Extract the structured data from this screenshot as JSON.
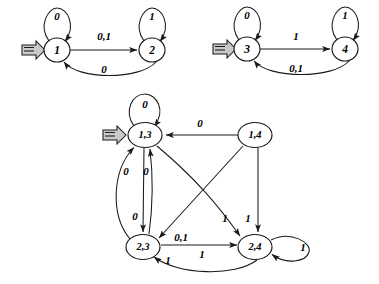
{
  "figure": {
    "background_color": "#ffffff",
    "stroke_color": "#1a1a1a",
    "start_marker_color": "#c9c9c9",
    "alphabet": [
      "0",
      "1"
    ]
  },
  "automata": [
    {
      "id": "automaton-a",
      "name": "automaton-left",
      "states": [
        {
          "id": "s1",
          "label": "1",
          "cx": 57,
          "cy": 50,
          "rx": 13,
          "ry": 12,
          "start": true
        },
        {
          "id": "s2",
          "label": "2",
          "cx": 152,
          "cy": 50,
          "rx": 13,
          "ry": 12,
          "start": false
        }
      ],
      "transitions": [
        {
          "from": "s1",
          "to": "s1",
          "label": "0",
          "kind": "self-loop-top",
          "label_x": 57,
          "label_y": 16
        },
        {
          "from": "s2",
          "to": "s2",
          "label": "1",
          "kind": "self-loop-top",
          "label_x": 152,
          "label_y": 16
        },
        {
          "from": "s1",
          "to": "s2",
          "label": "0,1",
          "kind": "straight",
          "label_x": 104,
          "label_y": 36
        },
        {
          "from": "s2",
          "to": "s1",
          "label": "0",
          "kind": "curve-below",
          "label_x": 104,
          "label_y": 68
        }
      ]
    },
    {
      "id": "automaton-b",
      "name": "automaton-right",
      "states": [
        {
          "id": "s3",
          "label": "3",
          "cx": 247,
          "cy": 49,
          "rx": 13,
          "ry": 12,
          "start": true
        },
        {
          "id": "s4",
          "label": "4",
          "cx": 345,
          "cy": 49,
          "rx": 13,
          "ry": 12,
          "start": false
        }
      ],
      "transitions": [
        {
          "from": "s3",
          "to": "s3",
          "label": "0",
          "kind": "self-loop-top",
          "label_x": 247,
          "label_y": 15
        },
        {
          "from": "s4",
          "to": "s4",
          "label": "1",
          "kind": "self-loop-top",
          "label_x": 345,
          "label_y": 15
        },
        {
          "from": "s3",
          "to": "s4",
          "label": "1",
          "kind": "straight",
          "label_x": 296,
          "label_y": 36
        },
        {
          "from": "s4",
          "to": "s3",
          "label": "0,1",
          "kind": "curve-below",
          "label_x": 296,
          "label_y": 67
        }
      ]
    },
    {
      "id": "automaton-product",
      "name": "product-automaton",
      "states": [
        {
          "id": "p13",
          "label": "1,3",
          "cx": 145,
          "cy": 135,
          "rx": 17,
          "ry": 12.5,
          "start": true
        },
        {
          "id": "p14",
          "label": "1,4",
          "cx": 255,
          "cy": 135,
          "rx": 17,
          "ry": 12.5,
          "start": false
        },
        {
          "id": "p23",
          "label": "2,3",
          "cx": 143,
          "cy": 247,
          "rx": 17,
          "ry": 12.5,
          "start": false
        },
        {
          "id": "p24",
          "label": "2,4",
          "cx": 255,
          "cy": 247,
          "rx": 17,
          "ry": 12.5,
          "start": false
        }
      ],
      "transitions": [
        {
          "from": "p13",
          "to": "p13",
          "label": "0",
          "kind": "self-loop-top",
          "label_x": 145,
          "label_y": 104
        },
        {
          "from": "p14",
          "to": "p13",
          "label": "0",
          "kind": "straight-horizontal",
          "label_x": 200,
          "label_y": 123
        },
        {
          "from": "p13",
          "to": "p23",
          "label": "0",
          "kind": "straight-vertical",
          "label_x": 135,
          "label_y": 216
        },
        {
          "from": "p23",
          "to": "p13",
          "label": "0",
          "kind": "vertical-inner",
          "label_x": 144,
          "label_y": 172
        },
        {
          "from": "p23",
          "to": "p13",
          "label": "0",
          "kind": "curve-left-outer",
          "label_x": 124,
          "label_y": 172
        },
        {
          "from": "p14",
          "to": "p23",
          "label": "0,1",
          "kind": "diagonal",
          "label_x": 180,
          "label_y": 237
        },
        {
          "from": "p13",
          "to": "p24",
          "label": "1",
          "kind": "diagonal-curve",
          "label_x": 226,
          "label_y": 218
        },
        {
          "from": "p14",
          "to": "p24",
          "label": "1",
          "kind": "straight-vertical",
          "label_x": 248,
          "label_y": 218
        },
        {
          "from": "p23",
          "to": "p24",
          "label": "1",
          "kind": "straight-horizontal",
          "label_x": 200,
          "label_y": 253
        },
        {
          "from": "p24",
          "to": "p23",
          "label": "1",
          "kind": "curve-below",
          "label_x": 166,
          "label_y": 262
        },
        {
          "from": "p24",
          "to": "p24",
          "label": "1",
          "kind": "self-loop-right",
          "label_x": 302,
          "label_y": 247
        }
      ]
    }
  ]
}
